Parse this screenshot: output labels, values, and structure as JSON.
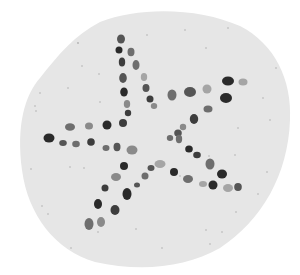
{
  "image": {
    "subject": "Pebble star mosaic on a round disc",
    "background_color": "#ffffff",
    "disc_color": "#e6e6e6",
    "speck_color": "#b0b0b0",
    "pebble_colors": [
      "#2a2a2a",
      "#3d3d3d",
      "#555555",
      "#6e6e6e",
      "#8a8a8a",
      "#a5a5a5"
    ]
  }
}
